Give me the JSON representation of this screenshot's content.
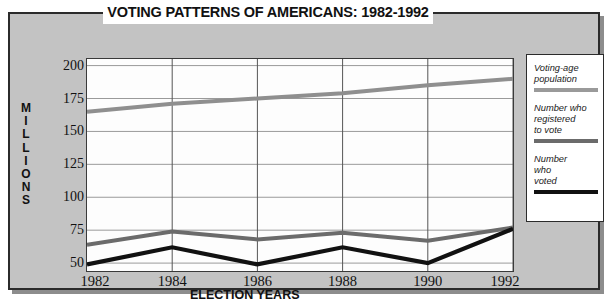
{
  "chart_data": {
    "type": "line",
    "title": "VOTING PATTERNS OF AMERICANS: 1982-1992",
    "xlabel": "ELECTION YEARS",
    "ylabel": "MILLIONS",
    "x": [
      1982,
      1984,
      1986,
      1988,
      1990,
      1992
    ],
    "xticklabels": [
      "1982",
      "1984",
      "1986",
      "1988",
      "1990",
      "1992"
    ],
    "yticklabels": [
      "50",
      "75",
      "100",
      "125",
      "150",
      "175",
      "200"
    ],
    "yticks": [
      50,
      75,
      100,
      125,
      150,
      175,
      200
    ],
    "ylim": [
      44,
      205
    ],
    "xlim": [
      1982,
      1992
    ],
    "grid": true,
    "legend_position": "right-outside",
    "series": [
      {
        "name": "Voting-age population",
        "color": "#8f8f8f",
        "values": [
          165,
          171,
          175,
          179,
          185,
          190
        ]
      },
      {
        "name": "Number who registered to vote",
        "color": "#6b6b6b",
        "values": [
          64,
          74,
          68,
          73,
          67,
          77
        ]
      },
      {
        "name": "Number who voted",
        "color": "#111111",
        "values": [
          49,
          62,
          49,
          62,
          50,
          76
        ]
      }
    ]
  },
  "legend": {
    "entries": [
      {
        "label": "Voting-age\npopulation",
        "line1": "Voting-age",
        "line2": "population",
        "line3": "",
        "color": "#9a9a9a"
      },
      {
        "label": "Number who registered to vote",
        "line1": "Number who",
        "line2": "registered",
        "line3": "to vote",
        "color": "#6b6b6b"
      },
      {
        "label": "Number who voted",
        "line1": "Number",
        "line2": "who",
        "line3": "voted",
        "color": "#111111"
      }
    ]
  },
  "colors": {
    "panel_background": "#c3c3c3",
    "plot_background": "#fdfdfd",
    "border": "#2b2b2b",
    "gridline": "#9a9a9a",
    "text": "#111111"
  }
}
